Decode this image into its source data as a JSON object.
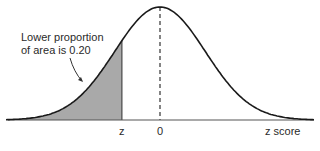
{
  "chart_data": {
    "type": "area",
    "title": "",
    "xlabel": "z score",
    "ylabel": "",
    "tick_labels": [
      "z",
      "0"
    ],
    "z_cutoff_value": -0.84,
    "shaded_region": "left tail below z",
    "shaded_proportion": 0.2,
    "annotation": {
      "line1": "Lower proportion",
      "line2": "of area is 0.20"
    },
    "mean_marker": {
      "x": 0,
      "style": "dashed"
    },
    "xlim": [
      -3.4,
      3.4
    ],
    "grid": false,
    "legend": null
  },
  "colors": {
    "curve": "#1a1a1a",
    "shade": "#a9a9a9",
    "baseline": "#555555",
    "text": "#2a2a2a"
  }
}
